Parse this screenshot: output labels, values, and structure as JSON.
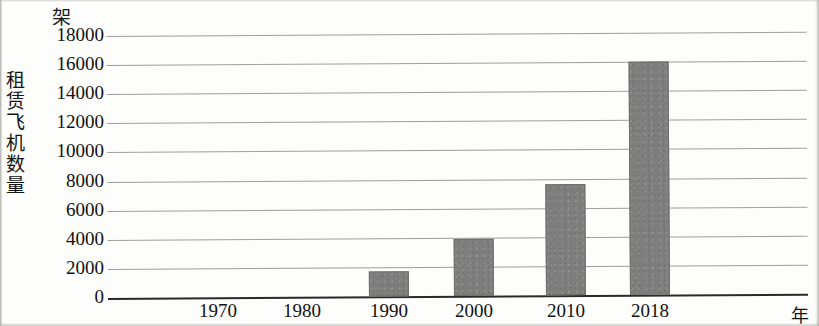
{
  "chart_data": {
    "type": "bar",
    "title": "",
    "xlabel": "年",
    "ylabel": "租赁飞机数量",
    "y_unit": "架",
    "categories": [
      "1970",
      "1980",
      "1990",
      "2000",
      "2010",
      "2018"
    ],
    "values": [
      0,
      0,
      1700,
      3900,
      7600,
      16000
    ],
    "ylim": [
      0,
      18000
    ],
    "y_ticks": [
      "18000",
      "16000",
      "14000",
      "12000",
      "10000",
      "8000",
      "6000",
      "4000",
      "2000",
      "0"
    ],
    "y_tick_values": [
      18000,
      16000,
      14000,
      12000,
      10000,
      8000,
      6000,
      4000,
      2000,
      0
    ],
    "y_tick_step": 2000,
    "grid": true,
    "legend": "none",
    "bar_color": "#7e7e7e",
    "grid_color": "#8e8e8e",
    "axis_color": "#2a2a2a",
    "series": [
      {
        "name": "租赁飞机数量",
        "values": [
          0,
          0,
          1700,
          3900,
          7600,
          16000
        ]
      }
    ]
  },
  "axis": {
    "y_unit_label": "架",
    "y_title_label": "租赁飞机数量",
    "x_unit_label": "年"
  }
}
